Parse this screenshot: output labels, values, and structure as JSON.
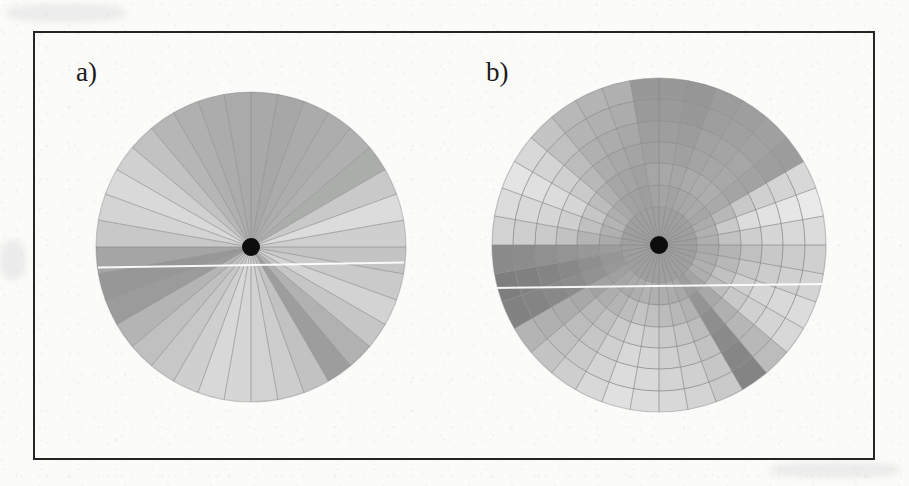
{
  "figure": {
    "background_color": "#fbfbfa",
    "frame_color": "#252525",
    "hub_color": "#0d0d0d",
    "sector_line_color": "#8a8a8a",
    "scanline_color": "#fdfdfd",
    "panel_a_label": "a)",
    "panel_b_label": "b)"
  },
  "chart_data": [
    {
      "type": "pie",
      "id": "panel-a",
      "title": "a)",
      "subtitle": "",
      "xlabel": "",
      "ylabel": "",
      "legend": "none",
      "grid": false,
      "description": "Polar sector diagram: disc divided into 36 equal angular sectors of 10 degrees each, each sector filled with a uniform gray level. Black hub dot at the centre.",
      "center_x": 251,
      "center_y": 247,
      "radius": 155,
      "hub_radius": 9,
      "sector_count": 36,
      "sector_degrees": 10,
      "categories": [
        "0-10",
        "10-20",
        "20-30",
        "30-40",
        "40-50",
        "50-60",
        "60-70",
        "70-80",
        "80-90",
        "90-100",
        "100-110",
        "110-120",
        "120-130",
        "130-140",
        "140-150",
        "150-160",
        "160-170",
        "170-180",
        "180-190",
        "190-200",
        "200-210",
        "210-220",
        "220-230",
        "230-240",
        "240-250",
        "250-260",
        "260-270",
        "270-280",
        "280-290",
        "290-300",
        "300-310",
        "310-320",
        "320-330",
        "330-340",
        "340-350",
        "350-360"
      ],
      "values": [
        168,
        166,
        170,
        172,
        174,
        170,
        166,
        164,
        168,
        170,
        172,
        176,
        178,
        180,
        176,
        174,
        170,
        166,
        162,
        160,
        158,
        156,
        150,
        146,
        142,
        138,
        142,
        148,
        152,
        156,
        160,
        164,
        168,
        170,
        172,
        174
      ],
      "ylim": [
        130,
        215
      ],
      "grays": [
        "#a9a9a9",
        "#a7a7a7",
        "#ababab",
        "#adadad",
        "#b0b0b0",
        "#abadab",
        "#c9c9c9",
        "#dcdcdc",
        "#cfcfcf",
        "#c4c4c4",
        "#cacaca",
        "#d3d3d3",
        "#c6c6c6",
        "#b1b1b1",
        "#9d9d9d",
        "#c2c2c2",
        "#cdcdcd",
        "#d2d2d2",
        "#d6d6d6",
        "#d8d8d8",
        "#cfcfcf",
        "#c7c7c7",
        "#c0c0c0",
        "#b4b4b4",
        "#9b9b9b",
        "#979797",
        "#a5a5a5",
        "#c8c8c8",
        "#d4d4d4",
        "#d9d9d9",
        "#d0d0d0",
        "#c2c2c2",
        "#b6b6b6",
        "#b0b0b0",
        "#acacac",
        "#aaaaaa"
      ]
    },
    {
      "type": "heatmap",
      "id": "panel-b",
      "title": "b)",
      "subtitle": "",
      "xlabel": "",
      "ylabel": "",
      "legend": "none",
      "grid": true,
      "description": "Polar sector-and-ring diagram: same 36 angular sectors of 10 degrees, further subdivided radially into an inner uniform core disc plus 6 concentric annular rings; each cell is filled with a uniform gray level. Black hub dot at the centre.",
      "center_x": 659,
      "center_y": 245,
      "radius": 167,
      "hub_radius": 9,
      "sector_count": 36,
      "sector_degrees": 10,
      "core_radius": 38,
      "ring_count": 6,
      "ring_radii": [
        38,
        60,
        82,
        103,
        124,
        146,
        167
      ],
      "core_gray": "#9f9f9f",
      "categories": [
        "0-10",
        "10-20",
        "20-30",
        "30-40",
        "40-50",
        "50-60",
        "60-70",
        "70-80",
        "80-90",
        "90-100",
        "100-110",
        "110-120",
        "120-130",
        "130-140",
        "140-150",
        "150-160",
        "160-170",
        "170-180",
        "180-190",
        "190-200",
        "200-210",
        "210-220",
        "220-230",
        "230-240",
        "240-250",
        "250-260",
        "260-270",
        "270-280",
        "280-290",
        "290-300",
        "300-310",
        "310-320",
        "320-330",
        "330-340",
        "340-350",
        "350-360"
      ],
      "rings": [
        "ring-1",
        "ring-2",
        "ring-3",
        "ring-4",
        "ring-5",
        "ring-6"
      ],
      "series": [
        {
          "name": "ring-1",
          "values": [
            160,
            158,
            162,
            164,
            166,
            162,
            168,
            172,
            170,
            166,
            168,
            172,
            170,
            160,
            152,
            164,
            168,
            170,
            172,
            174,
            170,
            166,
            162,
            156,
            148,
            146,
            152,
            166,
            172,
            176,
            170,
            164,
            158,
            156,
            154,
            158
          ]
        },
        {
          "name": "ring-2",
          "values": [
            164,
            162,
            166,
            168,
            170,
            166,
            172,
            180,
            176,
            170,
            172,
            176,
            174,
            164,
            150,
            168,
            172,
            174,
            176,
            178,
            174,
            170,
            166,
            158,
            146,
            142,
            150,
            170,
            176,
            180,
            174,
            168,
            162,
            160,
            158,
            162
          ]
        },
        {
          "name": "ring-3",
          "values": [
            158,
            156,
            160,
            162,
            164,
            160,
            178,
            186,
            180,
            174,
            176,
            180,
            178,
            168,
            146,
            172,
            176,
            178,
            180,
            182,
            178,
            172,
            168,
            160,
            142,
            138,
            148,
            174,
            180,
            184,
            178,
            170,
            164,
            162,
            160,
            156
          ]
        },
        {
          "name": "ring-4",
          "values": [
            154,
            152,
            158,
            160,
            162,
            158,
            182,
            190,
            184,
            178,
            180,
            184,
            182,
            172,
            144,
            176,
            180,
            182,
            184,
            186,
            180,
            174,
            170,
            162,
            140,
            136,
            146,
            178,
            184,
            188,
            180,
            172,
            166,
            164,
            162,
            154
          ]
        },
        {
          "name": "ring-5",
          "values": [
            150,
            148,
            154,
            156,
            158,
            154,
            184,
            192,
            186,
            180,
            182,
            186,
            184,
            174,
            142,
            178,
            182,
            184,
            186,
            188,
            182,
            176,
            172,
            164,
            138,
            134,
            144,
            180,
            186,
            190,
            182,
            174,
            168,
            166,
            164,
            150
          ]
        },
        {
          "name": "ring-6",
          "values": [
            148,
            146,
            152,
            154,
            156,
            152,
            186,
            194,
            188,
            182,
            184,
            188,
            186,
            176,
            140,
            180,
            184,
            186,
            188,
            190,
            184,
            178,
            174,
            166,
            136,
            132,
            142,
            182,
            188,
            192,
            184,
            176,
            170,
            168,
            166,
            148
          ]
        }
      ],
      "grays": [
        [
          "#a4a4a4",
          "#a2a2a2",
          "#a6a6a6",
          "#a8a8a8",
          "#aaaaaa",
          "#a6a6a6",
          "#acacac",
          "#b0b0b0",
          "#aeaeae",
          "#aaaaaa",
          "#acacac",
          "#b0b0b0",
          "#aeaeae",
          "#a4a4a4",
          "#9c9c9c",
          "#a8a8a8",
          "#acacac",
          "#aeaeae",
          "#b0b0b0",
          "#b2b2b2",
          "#aeaeae",
          "#aaaaaa",
          "#a6a6a6",
          "#a0a0a0",
          "#989898",
          "#969696",
          "#9c9c9c",
          "#aaaaaa",
          "#b0b0b0",
          "#b4b4b4",
          "#aeaeae",
          "#a8a8a8",
          "#a2a2a2",
          "#a0a0a0",
          "#9e9e9e",
          "#a2a2a2"
        ],
        [
          "#a8a8a8",
          "#a6a6a6",
          "#aaaaaa",
          "#acacac",
          "#aeaeae",
          "#aaaaaa",
          "#b8b8b8",
          "#cacaca",
          "#c2c2c2",
          "#b4b4b4",
          "#b8b8b8",
          "#c0c0c0",
          "#bcbcbc",
          "#a8a8a8",
          "#949494",
          "#b2b2b2",
          "#b8b8b8",
          "#bcbcbc",
          "#c0c0c0",
          "#c4c4c4",
          "#bcbcbc",
          "#b4b4b4",
          "#aeaeae",
          "#a2a2a2",
          "#929292",
          "#8e8e8e",
          "#989898",
          "#b4b4b4",
          "#c0c0c0",
          "#c6c6c6",
          "#bcbcbc",
          "#b0b0b0",
          "#a6a6a6",
          "#a4a4a4",
          "#a0a0a0",
          "#a6a6a6"
        ],
        [
          "#a2a2a2",
          "#a0a0a0",
          "#a4a4a4",
          "#a6a6a6",
          "#a8a8a8",
          "#a4a4a4",
          "#c8c8c8",
          "#dcdcdc",
          "#cfcfcf",
          "#c0c0c0",
          "#c6c6c6",
          "#cfcfcf",
          "#c8c8c8",
          "#b0b0b0",
          "#8e8e8e",
          "#bcbcbc",
          "#c6c6c6",
          "#cacaca",
          "#cfcfcf",
          "#d2d2d2",
          "#cacaca",
          "#c0c0c0",
          "#b8b8b8",
          "#a8a8a8",
          "#8c8c8c",
          "#888888",
          "#949494",
          "#c2c2c2",
          "#cfcfcf",
          "#d6d6d6",
          "#cacaca",
          "#b8b8b8",
          "#acacac",
          "#a8a8a8",
          "#a4a4a4",
          "#a0a0a0"
        ],
        [
          "#9e9e9e",
          "#9c9c9c",
          "#a2a2a2",
          "#a4a4a4",
          "#a6a6a6",
          "#a2a2a2",
          "#d0d0d0",
          "#e2e2e2",
          "#d6d6d6",
          "#c8c8c8",
          "#cccccc",
          "#d6d6d6",
          "#d0d0d0",
          "#b6b6b6",
          "#8a8a8a",
          "#c2c2c2",
          "#cccccc",
          "#d0d0d0",
          "#d6d6d6",
          "#d8d8d8",
          "#d0d0d0",
          "#c6c6c6",
          "#bcbcbc",
          "#acacac",
          "#888888",
          "#848484",
          "#909090",
          "#cacaca",
          "#d6d6d6",
          "#dcdcdc",
          "#d0d0d0",
          "#bcbcbc",
          "#b0b0b0",
          "#acacac",
          "#a8a8a8",
          "#9e9e9e"
        ],
        [
          "#9a9a9a",
          "#989898",
          "#9e9e9e",
          "#a0a0a0",
          "#a2a2a2",
          "#9e9e9e",
          "#d4d4d4",
          "#e6e6e6",
          "#d9d9d9",
          "#cccccc",
          "#d0d0d0",
          "#d9d9d9",
          "#d4d4d4",
          "#b8b8b8",
          "#868686",
          "#c6c6c6",
          "#d0d0d0",
          "#d4d4d4",
          "#d9d9d9",
          "#dcdcdc",
          "#d4d4d4",
          "#cacaca",
          "#c0c0c0",
          "#b0b0b0",
          "#848484",
          "#808080",
          "#8c8c8c",
          "#cecece",
          "#d9d9d9",
          "#e0e0e0",
          "#d4d4d4",
          "#c0c0c0",
          "#b4b4b4",
          "#b0b0b0",
          "#acacac",
          "#9a9a9a"
        ],
        [
          "#989898",
          "#969696",
          "#9c9c9c",
          "#9e9e9e",
          "#a0a0a0",
          "#9c9c9c",
          "#d8d8d8",
          "#eaeaea",
          "#dcdcdc",
          "#d0d0d0",
          "#d4d4d4",
          "#dcdcdc",
          "#d8d8d8",
          "#bcbcbc",
          "#848484",
          "#cacaca",
          "#d4d4d4",
          "#d8d8d8",
          "#dcdcdc",
          "#e0e0e0",
          "#d8d8d8",
          "#cecece",
          "#c4c4c4",
          "#b4b4b4",
          "#828282",
          "#7e7e7e",
          "#8a8a8a",
          "#d2d2d2",
          "#dcdcdc",
          "#e4e4e4",
          "#d8d8d8",
          "#c4c4c4",
          "#b8b8b8",
          "#b4b4b4",
          "#b0b0b0",
          "#989898"
        ]
      ]
    }
  ]
}
